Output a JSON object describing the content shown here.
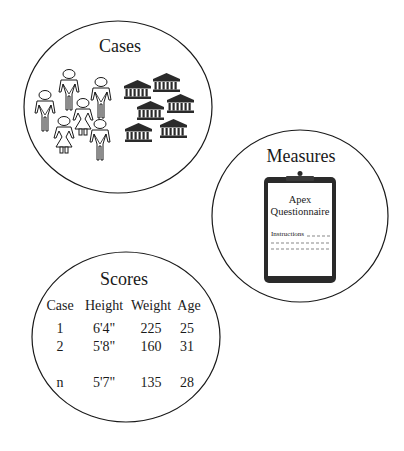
{
  "diagram": {
    "cases": {
      "title": "Cases",
      "people": [
        {
          "kind": "male-figure"
        },
        {
          "kind": "male-figure"
        },
        {
          "kind": "male-figure"
        },
        {
          "kind": "female-figure"
        },
        {
          "kind": "female-figure"
        },
        {
          "kind": "male-figure"
        }
      ],
      "buildings_count": 6,
      "building_icon": "bank-building-icon"
    },
    "measures": {
      "title": "Measures",
      "clipboard": {
        "icon": "clipboard-icon",
        "line1": "Apex",
        "line2": "Questionnaire",
        "instructions": "Instructions"
      }
    },
    "scores": {
      "title": "Scores",
      "headers": [
        "Case",
        "Height",
        "Weight",
        "Age"
      ],
      "rows": [
        [
          "1",
          "6'4\"",
          "225",
          "25"
        ],
        [
          "2",
          "5'8\"",
          "160",
          "31"
        ],
        [
          "n",
          "5'7\"",
          "135",
          "28"
        ]
      ]
    },
    "colors": {
      "ink": "#1a1a1a",
      "building_fill": "#2a2a2a",
      "background": "#ffffff"
    }
  }
}
